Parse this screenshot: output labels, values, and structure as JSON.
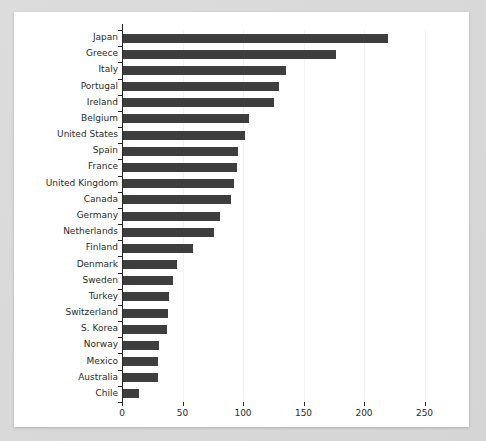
{
  "chart_data": {
    "type": "bar",
    "orientation": "horizontal",
    "title": "",
    "subtitle": "",
    "xlabel": "",
    "ylabel": "",
    "xlim": [
      0,
      270
    ],
    "ylim": [
      0,
      23
    ],
    "grid": true,
    "legend": null,
    "xticks": [
      0,
      50,
      100,
      150,
      200,
      250
    ],
    "xtick_labels": [
      "0",
      "50",
      "100",
      "150",
      "200",
      "250"
    ],
    "categories": [
      "Japan",
      "Greece",
      "Italy",
      "Portugal",
      "Ireland",
      "Belgium",
      "United States",
      "Spain",
      "France",
      "United Kingdom",
      "Canada",
      "Germany",
      "Netherlands",
      "Finland",
      "Denmark",
      "Sweden",
      "Turkey",
      "Switzerland",
      "S. Korea",
      "Norway",
      "Mexico",
      "Australia",
      "Chile"
    ],
    "values": [
      219,
      176,
      135,
      129,
      125,
      104,
      101,
      95,
      94,
      92,
      89,
      80,
      75,
      58,
      45,
      41,
      38,
      37,
      36,
      30,
      29,
      29,
      13
    ],
    "bar_color": "#3e3e3e",
    "background_color": "#ffffff",
    "frame_color": "#d9d9d9",
    "axis_color": "#262626",
    "grid_color": "#f2f2f2"
  }
}
